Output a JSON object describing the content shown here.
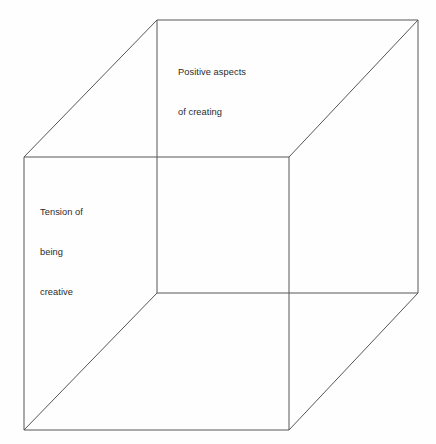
{
  "diagram": {
    "type": "cube-wireframe",
    "background_color": "#fefefe",
    "line_color": "#565656",
    "text_color": "#2b2b2b",
    "labels": {
      "back_face": {
        "name": "Positive aspects of creating",
        "lines": [
          "Positive aspects",
          "of creating"
        ]
      },
      "front_face": {
        "name": "Tension of being creative",
        "lines": [
          "Tension of",
          "being",
          "creative"
        ]
      }
    },
    "geometry": {
      "back_square": [
        [
          157,
          20
        ],
        [
          418,
          20
        ],
        [
          418,
          293
        ],
        [
          157,
          293
        ]
      ],
      "front_square": [
        [
          24,
          157
        ],
        [
          289,
          157
        ],
        [
          289,
          430
        ],
        [
          24,
          430
        ]
      ],
      "connectors": [
        [
          [
            157,
            20
          ],
          [
            24,
            157
          ]
        ],
        [
          [
            418,
            20
          ],
          [
            289,
            157
          ]
        ],
        [
          [
            418,
            293
          ],
          [
            289,
            430
          ]
        ],
        [
          [
            157,
            293
          ],
          [
            24,
            430
          ]
        ]
      ]
    }
  }
}
